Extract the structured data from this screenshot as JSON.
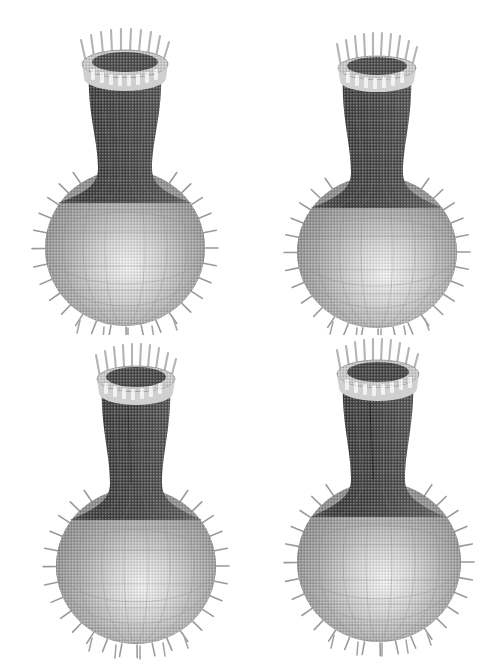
{
  "figure": {
    "background_color": "#ffffff",
    "render_style": "halftone-dithered-grayscale",
    "width": 502,
    "height": 670,
    "layout": "2x2 grid of rendered views",
    "caption": ""
  },
  "colors": {
    "background": "#ffffff",
    "neck_dark": "#4a4a4a",
    "neck_darkest": "#3a3a3a",
    "bulb_mid": "#9a9a9a",
    "bulb_light": "#e8e8e8",
    "bulb_edge": "#8a8a8a",
    "rim_top_dark": "#454545",
    "spike_gray": "#9a9a9a",
    "wire_line": "#6e6e6e"
  },
  "panels": [
    {
      "id": "panel-top-left",
      "position": "top-left",
      "label": "",
      "view_rotation_deg": 0,
      "seam_visible": false,
      "rim_spike_count": 24,
      "bulb_spike_count": 32,
      "neck_shading": "dark",
      "bulb_highlight_x_pct": 52,
      "bulb_highlight_y_pct": 62,
      "rim_width_pct": 34,
      "rim_tilt": "flat-ellipse",
      "geometry": {
        "cx": 125,
        "rim_cy": 62,
        "rim_rx": 42,
        "rim_ry": 13,
        "neck_top_half_width": 36,
        "neck_waist_half_width": 27,
        "neck_waist_y": 150,
        "neck_bottom_y": 196,
        "bulb_cy": 248,
        "bulb_rx": 80,
        "bulb_ry": 78
      }
    },
    {
      "id": "panel-top-right",
      "position": "top-right",
      "label": "",
      "view_rotation_deg": 12,
      "seam_visible": false,
      "rim_spike_count": 24,
      "bulb_spike_count": 32,
      "neck_shading": "dark",
      "bulb_highlight_x_pct": 55,
      "bulb_highlight_y_pct": 64,
      "rim_width_pct": 30,
      "rim_tilt": "slight-tilt",
      "geometry": {
        "cx": 376,
        "rim_cy": 66,
        "rim_rx": 38,
        "rim_ry": 11,
        "neck_top_half_width": 33,
        "neck_waist_half_width": 26,
        "neck_waist_y": 156,
        "neck_bottom_y": 200,
        "bulb_cy": 252,
        "bulb_rx": 80,
        "bulb_ry": 76
      }
    },
    {
      "id": "panel-bottom-left",
      "position": "bottom-left",
      "label": "",
      "view_rotation_deg": 24,
      "seam_visible": true,
      "rim_spike_count": 24,
      "bulb_spike_count": 32,
      "neck_shading": "dark",
      "bulb_highlight_x_pct": 54,
      "bulb_highlight_y_pct": 63,
      "rim_width_pct": 31,
      "rim_tilt": "tilted-ellipse",
      "geometry": {
        "cx": 136,
        "rim_cy": 382,
        "rim_rx": 38,
        "rim_ry": 12,
        "neck_top_half_width": 34,
        "neck_waist_half_width": 26,
        "neck_waist_y": 470,
        "neck_bottom_y": 512,
        "bulb_cy": 566,
        "bulb_rx": 80,
        "bulb_ry": 78
      }
    },
    {
      "id": "panel-bottom-right",
      "position": "bottom-right",
      "label": "",
      "view_rotation_deg": 36,
      "seam_visible": true,
      "rim_spike_count": 24,
      "bulb_spike_count": 32,
      "neck_shading": "dark",
      "bulb_highlight_x_pct": 53,
      "bulb_highlight_y_pct": 62,
      "rim_width_pct": 33,
      "rim_tilt": "tilted-ellipse",
      "geometry": {
        "cx": 379,
        "rim_cy": 378,
        "rim_rx": 40,
        "rim_ry": 13,
        "neck_top_half_width": 36,
        "neck_waist_half_width": 27,
        "neck_waist_y": 468,
        "neck_bottom_y": 508,
        "bulb_cy": 562,
        "bulb_rx": 82,
        "bulb_ry": 80
      }
    }
  ],
  "annotations": {
    "normals_description": "short line segments (surface normals) emanating outward from mesh vertices along the silhouette of the rim and bulb",
    "mesh_description": "faint quadrilateral wireframe grid overlaid on shaded surface",
    "shading_description": "Phong-like shading: dark neck, bright specular highlight low-center on the bulb"
  }
}
